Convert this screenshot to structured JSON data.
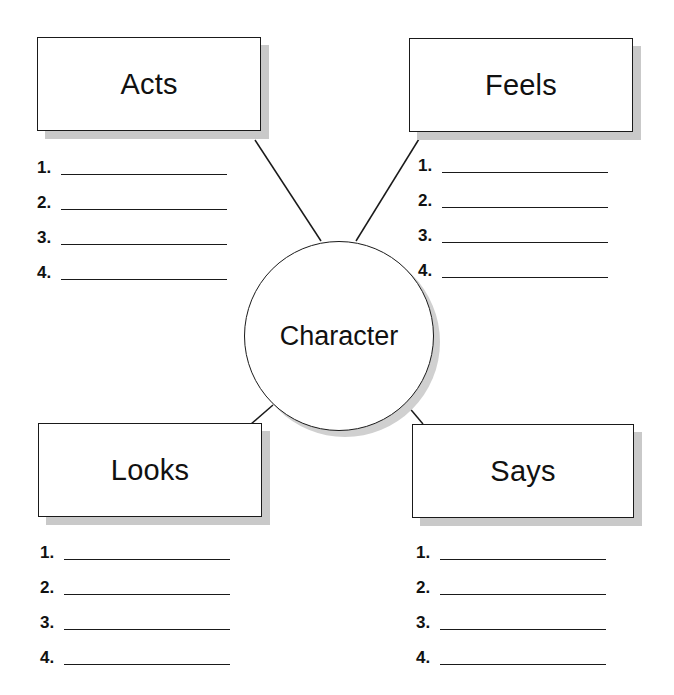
{
  "diagram": {
    "type": "character web organizer",
    "center": {
      "label": "Character"
    },
    "boxes": [
      {
        "id": "acts",
        "label": "Acts",
        "items": [
          "1.",
          "2.",
          "3.",
          "4."
        ]
      },
      {
        "id": "feels",
        "label": "Feels",
        "items": [
          "1.",
          "2.",
          "3.",
          "4."
        ]
      },
      {
        "id": "looks",
        "label": "Looks",
        "items": [
          "1.",
          "2.",
          "3.",
          "4."
        ]
      },
      {
        "id": "says",
        "label": "Says",
        "items": [
          "1.",
          "2.",
          "3.",
          "4."
        ]
      }
    ]
  },
  "colors": {
    "line": "#1a1a1a",
    "shadow": "#c9c9c9",
    "background": "#ffffff"
  }
}
